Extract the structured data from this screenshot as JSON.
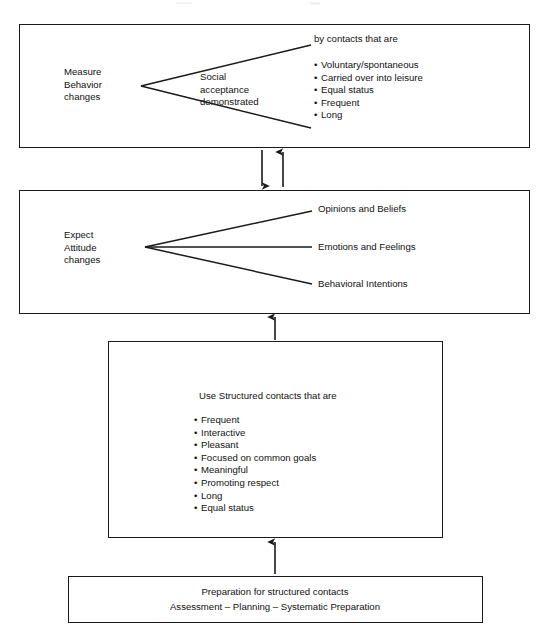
{
  "diagram": {
    "line_color": "#1a1a1a",
    "box_border_color": "#1a1a1a",
    "background_color": "#ffffff"
  },
  "boxes": {
    "measure_behavior": {
      "left_label": "Measure\nBehavior\nchanges",
      "wedge_label": "Social\nacceptance\ndemonstrated",
      "right_heading": "by contacts that are",
      "right_bullets": [
        "Voluntary/spontaneous",
        "Carried over into leisure",
        "Equal status",
        "Frequent",
        "Long"
      ]
    },
    "expect_attitude": {
      "left_label": "Expect\nAttitude\nchanges",
      "branches": [
        "Opinions and Beliefs",
        "Emotions and Feelings",
        "Behavioral Intentions"
      ]
    },
    "structured_contacts": {
      "heading": "Use Structured contacts that are",
      "bullets": [
        "Frequent",
        "Interactive",
        "Pleasant",
        "Focused on common goals",
        "Meaningful",
        "Promoting respect",
        "Long",
        "Equal status"
      ]
    },
    "preparation": {
      "line1": "Preparation for structured contacts",
      "line2": "Assessment   –   Planning   –   Systematic Preparation"
    }
  },
  "connectors": [
    {
      "name": "behavior-to-attitude-down-arrow",
      "direction": "down"
    },
    {
      "name": "attitude-to-behavior-up-arrow",
      "direction": "up"
    },
    {
      "name": "structured-to-attitude-up-arrow",
      "direction": "up"
    },
    {
      "name": "preparation-to-structured-up-arrow",
      "direction": "up"
    }
  ]
}
